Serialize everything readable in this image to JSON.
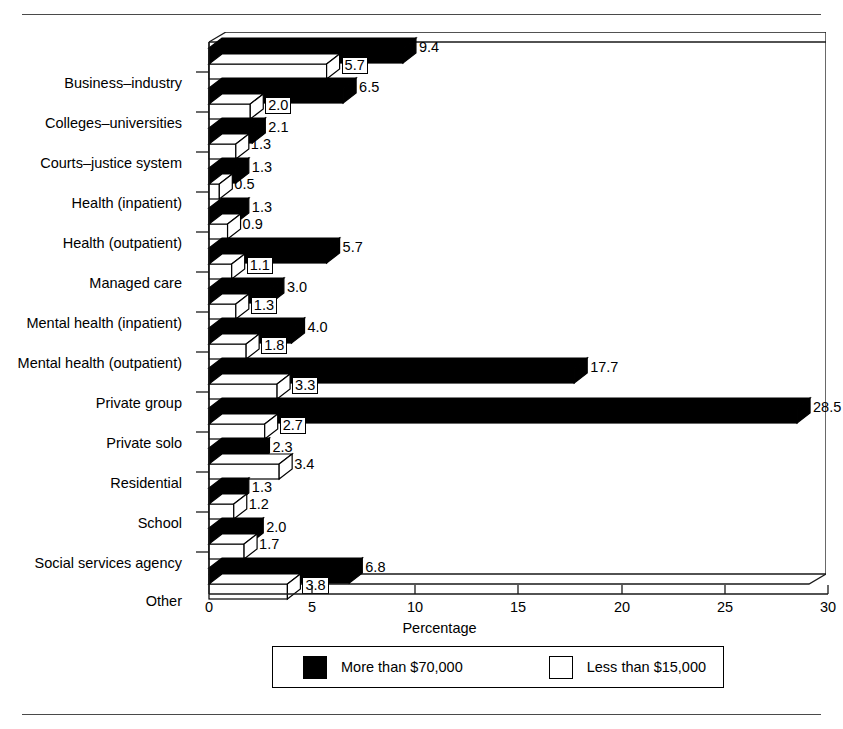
{
  "chart_data": {
    "type": "bar",
    "orientation": "horizontal",
    "title": "",
    "xlabel": "Percentage",
    "ylabel": "",
    "xlim": [
      0,
      30
    ],
    "xticks": [
      0,
      5,
      10,
      15,
      20,
      25,
      30
    ],
    "grid": false,
    "legend_position": "bottom",
    "categories": [
      "Business–industry",
      "Colleges–universities",
      "Courts–justice system",
      "Health (inpatient)",
      "Health (outpatient)",
      "Managed care",
      "Mental health (inpatient)",
      "Mental health (outpatient)",
      "Private group",
      "Private solo",
      "Residential",
      "School",
      "Social services agency",
      "Other"
    ],
    "series": [
      {
        "name": "More than $70,000",
        "color": "#000000",
        "values": [
          9.4,
          6.5,
          2.1,
          1.3,
          1.3,
          5.7,
          3.0,
          4.0,
          17.7,
          28.5,
          2.3,
          1.3,
          2.0,
          6.8
        ]
      },
      {
        "name": "Less than $15,000",
        "color": "#ffffff",
        "values": [
          5.7,
          2.0,
          1.3,
          0.5,
          0.9,
          1.1,
          1.3,
          1.8,
          3.3,
          2.7,
          3.4,
          1.2,
          1.7,
          3.8
        ]
      }
    ]
  },
  "axis": {
    "x_title": "Percentage",
    "tick_labels": [
      "0",
      "5",
      "10",
      "15",
      "20",
      "25",
      "30"
    ]
  },
  "legend": {
    "items": [
      {
        "label": "More than $70,000",
        "swatch": "dark"
      },
      {
        "label": "Less than $15,000",
        "swatch": "light"
      }
    ]
  },
  "value_labels": {
    "dark": [
      "9.4",
      "6.5",
      "2.1",
      "1.3",
      "1.3",
      "5.7",
      "3.0",
      "4.0",
      "17.7",
      "28.5",
      "2.3",
      "1.3",
      "2.0",
      "6.8"
    ],
    "light": [
      "5.7",
      "2.0",
      "1.3",
      "0.5",
      "0.9",
      "1.1",
      "1.3",
      "1.8",
      "3.3",
      "2.7",
      "3.4",
      "1.2",
      "1.7",
      "3.8"
    ]
  }
}
